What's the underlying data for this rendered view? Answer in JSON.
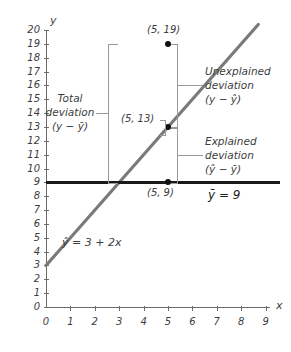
{
  "chart_data": {
    "type": "scatter",
    "title": "",
    "xlabel": "x",
    "ylabel": "y",
    "xlim": [
      0,
      9.6
    ],
    "ylim": [
      0,
      20.6
    ],
    "grid": false,
    "legend": "none",
    "x_ticks": [
      "0",
      "1",
      "2",
      "3",
      "4",
      "5",
      "6",
      "7",
      "8",
      "9"
    ],
    "y_ticks": [
      "0",
      "1",
      "2",
      "3",
      "4",
      "5",
      "6",
      "7",
      "8",
      "9",
      "10",
      "11",
      "12",
      "13",
      "14",
      "15",
      "16",
      "17",
      "18",
      "19",
      "20"
    ],
    "points": [
      {
        "label": "(5, 19)",
        "x": 5,
        "y": 19,
        "role": "observed-value"
      },
      {
        "label": "(5, 13)",
        "x": 5,
        "y": 13,
        "role": "predicted-value"
      },
      {
        "label": "(5, 9)",
        "x": 5,
        "y": 9,
        "role": "mean-value"
      }
    ],
    "series": [
      {
        "name": "regression-line",
        "equation": "ŷ = 3 + 2x",
        "intercept": 3,
        "slope": 2,
        "color": "#7a7a7a",
        "x_start": 0,
        "y_start": 3,
        "x_end": 8.7,
        "y_end": 20.4
      },
      {
        "name": "mean-line",
        "equation": "ȳ = 9",
        "value": 9,
        "color": "#1a1a1a",
        "x_start": 0,
        "x_end": 9.6
      }
    ],
    "annotations": [
      {
        "name": "total-deviation",
        "line1": "Total",
        "line2": "deviation",
        "line3": "(y − ȳ)",
        "span_from": 9,
        "span_to": 19
      },
      {
        "name": "unexplained-deviation",
        "line1": "Unexplained",
        "line2": "deviation",
        "line3": "(y − ŷ)",
        "span_from": 13,
        "span_to": 19
      },
      {
        "name": "explained-deviation",
        "line1": "Explained",
        "line2": "deviation",
        "line3": "(ŷ − ȳ)",
        "span_from": 9,
        "span_to": 13
      }
    ],
    "equations": {
      "regression": "ŷ = 3 + 2x",
      "mean": "ȳ = 9"
    }
  },
  "axes": {
    "y_label": "y",
    "x_label": "x"
  },
  "colors": {
    "regression": "#7a7a7a",
    "mean": "#1a1a1a",
    "axis": "#6b6b6b",
    "bracket": "#9a9a9a",
    "text": "#3d3d3d"
  }
}
